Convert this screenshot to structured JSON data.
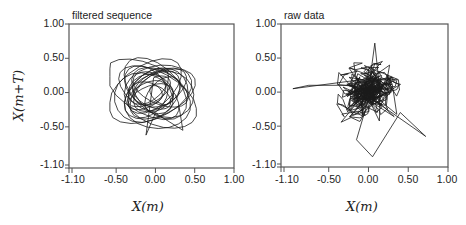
{
  "y_axis_label": "X(m+T)",
  "chart_data": [
    {
      "type": "line",
      "title": "filtered sequence",
      "xlabel": "X(m)",
      "ylabel": "X(m+T)",
      "xlim": [
        -1.1,
        1.0
      ],
      "ylim": [
        -1.1,
        1.0
      ],
      "x_ticks": [
        "-1.10",
        "-0.50",
        "0.00",
        "0.50",
        "1.00"
      ],
      "y_ticks": [
        "1.00",
        "0.50",
        "0.00",
        "-0.50",
        "-1.10"
      ],
      "grid": false,
      "legend": null,
      "description": "Phase-space trajectory of smoothed signal: overlapping loops centered near origin",
      "extent": {
        "x": [
          -0.55,
          0.5
        ],
        "y": [
          -0.6,
          0.55
        ]
      },
      "series": [
        {
          "name": "filtered sequence",
          "style": "smooth loops",
          "center": [
            -0.02,
            0.0
          ],
          "radius": 0.42,
          "n_points": 420,
          "seed": 7
        }
      ]
    },
    {
      "type": "line",
      "title": "raw data",
      "xlabel": "X(m)",
      "ylabel": "",
      "xlim": [
        -1.1,
        1.0
      ],
      "ylim": [
        -1.1,
        1.0
      ],
      "x_ticks": [
        "-1.10",
        "-0.50",
        "0.00",
        "0.50",
        "1.00"
      ],
      "y_ticks": [
        "1.00",
        "0.50",
        "0.00",
        "-0.50",
        "-1.10"
      ],
      "grid": false,
      "legend": null,
      "description": "Phase-space trajectory of raw noisy signal: dense jagged cluster near origin with outliers",
      "extent": {
        "x": [
          -1.0,
          0.75
        ],
        "y": [
          -1.0,
          0.75
        ]
      },
      "series": [
        {
          "name": "raw data",
          "style": "jagged",
          "center": [
            0.0,
            0.02
          ],
          "radius": 0.35,
          "n_points": 520,
          "seed": 13
        }
      ]
    }
  ],
  "panels": [
    {
      "title": "filtered sequence",
      "xlabel": "X(m)",
      "x_ticks": [
        "-1.10",
        "-0.50",
        "0.00",
        "0.50",
        "1.00"
      ],
      "y_ticks": [
        "1.00",
        "0.50",
        "0.00",
        "-0.50",
        "-1.10"
      ]
    },
    {
      "title": "raw data",
      "xlabel": "X(m)",
      "x_ticks": [
        "-1.10",
        "-0.50",
        "0.00",
        "0.50",
        "1.00"
      ],
      "y_ticks": [
        "1.00",
        "0.50",
        "0.00",
        "-0.50",
        "-1.10"
      ]
    }
  ],
  "colors": {
    "line": "#1a1a1a",
    "axis": "#555555",
    "background": "#ffffff"
  }
}
